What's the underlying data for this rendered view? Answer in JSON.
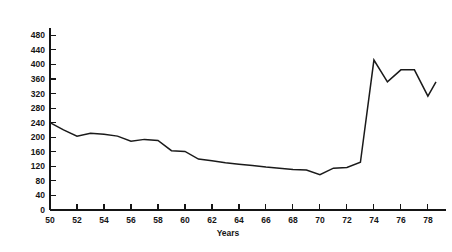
{
  "chart_data": {
    "type": "line",
    "title": "",
    "subtitle": "",
    "xlabel": "Years",
    "ylabel": "",
    "xlim": [
      50,
      78.6
    ],
    "ylim": [
      0,
      500
    ],
    "grid": false,
    "legend": null,
    "legend_position": "none",
    "x_tick_labels": [
      "50",
      "52",
      "54",
      "56",
      "58",
      "60",
      "62",
      "64",
      "66",
      "68",
      "70",
      "72",
      "74",
      "76",
      "78"
    ],
    "x_ticks": [
      50,
      52,
      54,
      56,
      58,
      60,
      62,
      64,
      66,
      68,
      70,
      72,
      74,
      76,
      78
    ],
    "y_tick_labels": [
      "0",
      "40",
      "80",
      "120",
      "160",
      "200",
      "240",
      "280",
      "320",
      "360",
      "400",
      "440",
      "480"
    ],
    "y_ticks": [
      0,
      40,
      80,
      120,
      160,
      200,
      240,
      280,
      320,
      360,
      400,
      440,
      480
    ],
    "series": [
      {
        "name": "series-1",
        "color": "#1a1a1a",
        "x": [
          50,
          51,
          52,
          53,
          54,
          55,
          56,
          57,
          58,
          59,
          60,
          61,
          62,
          63,
          64,
          65,
          66,
          67,
          68,
          69,
          70,
          71,
          72,
          73,
          74,
          75,
          76,
          77,
          78,
          78.6
        ],
        "values": [
          240,
          220,
          203,
          211,
          208,
          203,
          189,
          194,
          191,
          163,
          161,
          140,
          135,
          130,
          126,
          122,
          118,
          115,
          111,
          110,
          97,
          115,
          117,
          131,
          412,
          352,
          385,
          385,
          313,
          352
        ]
      }
    ]
  },
  "axis": {
    "x_title": "Years"
  }
}
